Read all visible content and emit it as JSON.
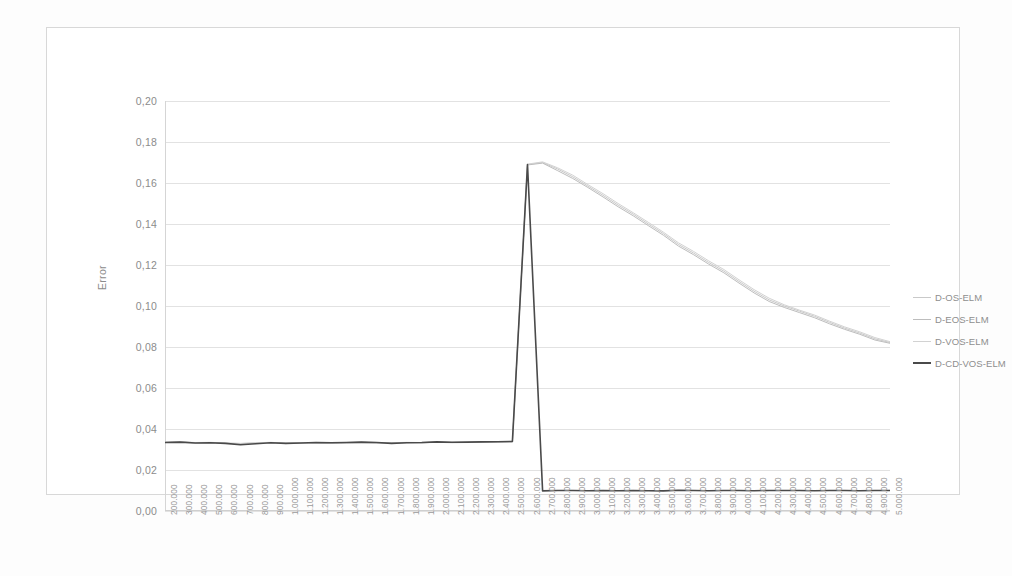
{
  "chart_data": {
    "type": "line",
    "title": "",
    "xlabel": "",
    "ylabel": "Error",
    "ylim": [
      0.0,
      0.2
    ],
    "ytick_labels": [
      "0,20",
      "0,18",
      "0,16",
      "0,14",
      "0,12",
      "0,10",
      "0,08",
      "0,06",
      "0,04",
      "0,02",
      "0,00"
    ],
    "ytick_values": [
      0.2,
      0.18,
      0.16,
      0.14,
      0.12,
      0.1,
      0.08,
      0.06,
      0.04,
      0.02,
      0.0
    ],
    "grid": true,
    "legend_position": "right",
    "xtick_labels": [
      "200.000",
      "300.000",
      "400.000",
      "500.000",
      "600.000",
      "700.000",
      "800.000",
      "900.000",
      "1.000.000",
      "1.100.000",
      "1.200.000",
      "1.300.000",
      "1.400.000",
      "1.500.000",
      "1.600.000",
      "1.700.000",
      "1.800.000",
      "1.900.000",
      "2.000.000",
      "2.100.000",
      "2.200.000",
      "2.300.000",
      "2.400.000",
      "2.500.000",
      "2.600.000",
      "2.700.000",
      "2.800.000",
      "2.900.000",
      "3.000.000",
      "3.100.000",
      "3.200.000",
      "3.300.000",
      "3.400.000",
      "3.500.000",
      "3.600.000",
      "3.700.000",
      "3.800.000",
      "3.900.000",
      "4.000.000",
      "4.100.000",
      "4.200.000",
      "4.300.000",
      "4.400.000",
      "4.500.000",
      "4.600.000",
      "4.700.000",
      "4.800.000",
      "4.900.000",
      "5.000.000"
    ],
    "x": [
      200000,
      300000,
      400000,
      500000,
      600000,
      700000,
      800000,
      900000,
      1000000,
      1100000,
      1200000,
      1300000,
      1400000,
      1500000,
      1600000,
      1700000,
      1800000,
      1900000,
      2000000,
      2100000,
      2200000,
      2300000,
      2400000,
      2500000,
      2600000,
      2700000,
      2800000,
      2900000,
      3000000,
      3100000,
      3200000,
      3300000,
      3400000,
      3500000,
      3600000,
      3700000,
      3800000,
      3900000,
      4000000,
      4100000,
      4200000,
      4300000,
      4400000,
      4500000,
      4600000,
      4700000,
      4800000,
      4900000,
      5000000
    ],
    "series": [
      {
        "name": "D-OS-ELM",
        "color": "#c9c9c9",
        "width": 1.0,
        "values": [
          0.0335,
          0.0337,
          0.0333,
          0.0334,
          0.0331,
          0.0329,
          0.0332,
          0.0334,
          0.033,
          0.0332,
          0.0333,
          0.0331,
          0.0333,
          0.0335,
          0.0333,
          0.0332,
          0.0334,
          0.0333,
          0.0336,
          0.0334,
          0.0335,
          0.0336,
          0.0337,
          0.0338,
          0.169,
          0.17,
          0.1668,
          0.163,
          0.1585,
          0.154,
          0.1492,
          0.1448,
          0.14,
          0.1353,
          0.13,
          0.1258,
          0.1212,
          0.117,
          0.112,
          0.1072,
          0.103,
          0.1,
          0.0975,
          0.095,
          0.092,
          0.0892,
          0.0868,
          0.084,
          0.0822
        ]
      },
      {
        "name": "D-EOS-ELM",
        "color": "#bdbdbd",
        "width": 1.0,
        "values": [
          0.0334,
          0.0336,
          0.0332,
          0.0333,
          0.033,
          0.0328,
          0.0331,
          0.0333,
          0.0329,
          0.0331,
          0.0332,
          0.033,
          0.0332,
          0.0334,
          0.0332,
          0.0331,
          0.0333,
          0.0332,
          0.0335,
          0.0333,
          0.0334,
          0.0335,
          0.0336,
          0.0337,
          0.1688,
          0.1697,
          0.166,
          0.1622,
          0.1578,
          0.1532,
          0.1484,
          0.144,
          0.1392,
          0.1345,
          0.1292,
          0.125,
          0.1204,
          0.1162,
          0.1112,
          0.1064,
          0.1022,
          0.0993,
          0.0968,
          0.0943,
          0.0913,
          0.0886,
          0.0862,
          0.0834,
          0.0818
        ]
      },
      {
        "name": "D-VOS-ELM",
        "color": "#d2d2d2",
        "width": 1.0,
        "values": [
          0.0336,
          0.0338,
          0.0334,
          0.0335,
          0.0332,
          0.033,
          0.0333,
          0.0335,
          0.0331,
          0.0333,
          0.0334,
          0.0332,
          0.0334,
          0.0336,
          0.0334,
          0.0333,
          0.0335,
          0.0334,
          0.0337,
          0.0335,
          0.0336,
          0.0337,
          0.0338,
          0.0339,
          0.1692,
          0.1703,
          0.1674,
          0.1638,
          0.1592,
          0.1548,
          0.15,
          0.1455,
          0.1408,
          0.136,
          0.1308,
          0.1266,
          0.122,
          0.1178,
          0.1128,
          0.108,
          0.1038,
          0.1006,
          0.098,
          0.0956,
          0.0926,
          0.0898,
          0.0874,
          0.0846,
          0.0826
        ]
      },
      {
        "name": "D-CD-VOS-ELM",
        "color": "#4a4a4a",
        "width": 1.6,
        "values": [
          0.0334,
          0.0336,
          0.0332,
          0.0333,
          0.033,
          0.0323,
          0.0328,
          0.0333,
          0.033,
          0.0332,
          0.0334,
          0.0333,
          0.0334,
          0.0336,
          0.0334,
          0.033,
          0.0333,
          0.0334,
          0.0337,
          0.0335,
          0.0336,
          0.0337,
          0.0338,
          0.0339,
          0.169,
          0.0098,
          0.01,
          0.01,
          0.0099,
          0.01,
          0.0099,
          0.01,
          0.0099,
          0.0098,
          0.0101,
          0.01,
          0.0099,
          0.01,
          0.01,
          0.0099,
          0.01,
          0.01,
          0.01,
          0.0099,
          0.01,
          0.01,
          0.0099,
          0.01,
          0.01
        ]
      }
    ]
  },
  "legend": {
    "items": [
      {
        "label": "D-OS-ELM",
        "color": "#c9c9c9",
        "width": 1.0
      },
      {
        "label": "D-EOS-ELM",
        "color": "#bdbdbd",
        "width": 1.2
      },
      {
        "label": "D-VOS-ELM",
        "color": "#d2d2d2",
        "width": 1.0
      },
      {
        "label": "D-CD-VOS-ELM",
        "color": "#4a4a4a",
        "width": 2.0
      }
    ]
  },
  "colors": {
    "gridline": "#e2e2e2",
    "frame": "#d8d8d8",
    "tick_text": "#8c8c8c",
    "background": "#ffffff"
  }
}
